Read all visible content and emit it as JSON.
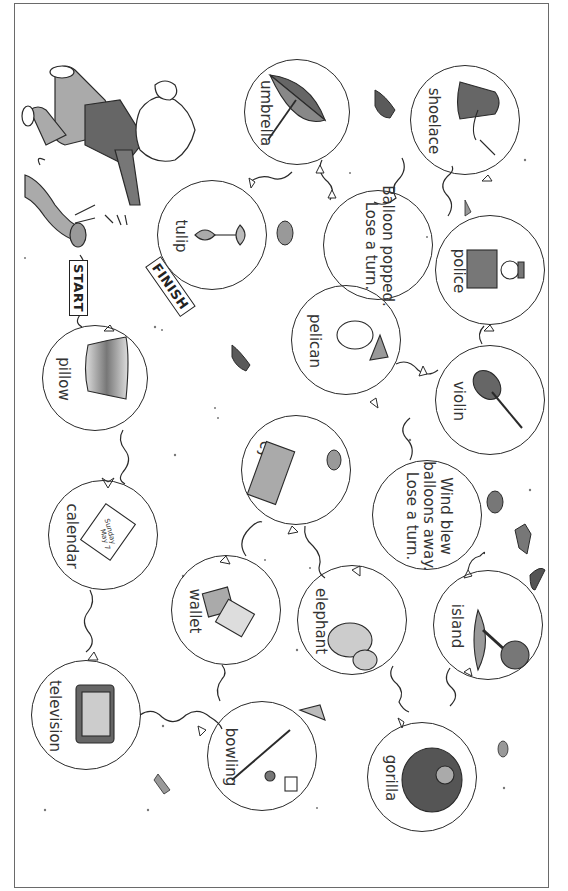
{
  "board": {
    "title": "Balloon board game",
    "start_label": "START",
    "finish_label": "FINISH",
    "colors": {
      "border": "#6a6a6a",
      "line": "#2a2a2a",
      "shade": "#8a8a8a",
      "dark": "#5a5a5a"
    }
  },
  "spaces": [
    {
      "id": "pillow",
      "label": "pillow",
      "icon": "pillow-icon",
      "cx": 95,
      "cy": 378,
      "r": 53
    },
    {
      "id": "calendar",
      "label": "calendar",
      "icon": "calendar-icon",
      "cx": 103,
      "cy": 535,
      "r": 55,
      "icon_text": "Sunday May 7"
    },
    {
      "id": "television",
      "label": "television",
      "icon": "television-icon",
      "cx": 86,
      "cy": 715,
      "r": 55
    },
    {
      "id": "bowling",
      "label": "bowling",
      "icon": "bowling-icon",
      "cx": 262,
      "cy": 756,
      "r": 55
    },
    {
      "id": "wallet",
      "label": "wallet",
      "icon": "wallet-icon",
      "cx": 226,
      "cy": 610,
      "r": 55
    },
    {
      "id": "cylinder",
      "label": "cylinder",
      "icon": "cylinder-icon",
      "cx": 296,
      "cy": 470,
      "r": 55
    },
    {
      "id": "elephant",
      "label": "elephant",
      "icon": "elephant-icon",
      "cx": 352,
      "cy": 620,
      "r": 55
    },
    {
      "id": "gorilla",
      "label": "gorilla",
      "icon": "gorilla-icon",
      "cx": 422,
      "cy": 777,
      "r": 55
    },
    {
      "id": "island",
      "label": "island",
      "icon": "island-icon",
      "cx": 488,
      "cy": 625,
      "r": 55
    },
    {
      "id": "wind",
      "label_lines": [
        "Wind blew",
        "balloons away.",
        "Lose a turn."
      ],
      "icon": "",
      "cx": 427,
      "cy": 515,
      "r": 55
    },
    {
      "id": "violin",
      "label": "violin",
      "icon": "violin-icon",
      "cx": 490,
      "cy": 400,
      "r": 55
    },
    {
      "id": "pelican",
      "label": "pelican",
      "icon": "pelican-icon",
      "cx": 346,
      "cy": 340,
      "r": 55
    },
    {
      "id": "police",
      "label": "police",
      "icon": "police-icon",
      "cx": 490,
      "cy": 270,
      "r": 55
    },
    {
      "id": "shoelace",
      "label": "shoelace",
      "icon": "shoelace-icon",
      "cx": 465,
      "cy": 120,
      "r": 55
    },
    {
      "id": "popped",
      "label_lines": [
        "Balloon popped.",
        "Lose a turn."
      ],
      "icon": "",
      "cx": 378,
      "cy": 245,
      "r": 55
    },
    {
      "id": "umbrella",
      "label": "umbrella",
      "icon": "umbrella-icon",
      "cx": 297,
      "cy": 112,
      "r": 53
    },
    {
      "id": "tulip",
      "label": "tulip",
      "icon": "tulip-icon",
      "cx": 212,
      "cy": 235,
      "r": 55
    }
  ]
}
